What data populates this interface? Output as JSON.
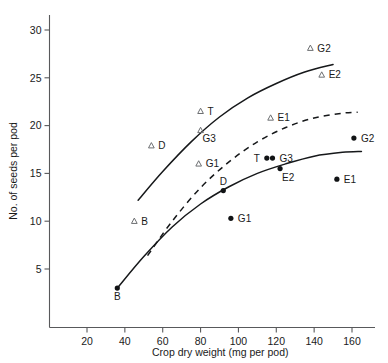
{
  "chart_data": {
    "type": "scatter",
    "title": "",
    "xlabel": "Crop dry weight (mg per pod)",
    "ylabel": "No. of seeds per pod",
    "xlim": [
      5,
      167
    ],
    "ylim": [
      1,
      32
    ],
    "grid": false,
    "legend": "none",
    "xticks": [
      20,
      40,
      60,
      80,
      100,
      120,
      140,
      160
    ],
    "yticks": [
      5,
      10,
      15,
      20,
      25,
      30
    ],
    "series": [
      {
        "name": "open-triangles",
        "marker": "open-triangle",
        "points": [
          {
            "label": "B",
            "x": 45,
            "y": 10.0,
            "label_side": "right"
          },
          {
            "label": "D",
            "x": 54,
            "y": 17.9,
            "label_side": "right"
          },
          {
            "label": "G1",
            "x": 79,
            "y": 16.0,
            "label_side": "right"
          },
          {
            "label": "G3",
            "x": 80,
            "y": 19.5,
            "label_side": "below-right"
          },
          {
            "label": "T",
            "x": 80,
            "y": 21.5,
            "label_side": "right"
          },
          {
            "label": "E1",
            "x": 117,
            "y": 20.8,
            "label_side": "right"
          },
          {
            "label": "G2",
            "x": 138,
            "y": 28.1,
            "label_side": "right"
          },
          {
            "label": "E2",
            "x": 144,
            "y": 25.3,
            "label_side": "right"
          }
        ]
      },
      {
        "name": "filled-circles",
        "marker": "filled-circle",
        "points": [
          {
            "label": "B",
            "x": 36,
            "y": 3.0,
            "label_side": "below"
          },
          {
            "label": "G1",
            "x": 96,
            "y": 10.3,
            "label_side": "right"
          },
          {
            "label": "D",
            "x": 92,
            "y": 13.2,
            "label_side": "above"
          },
          {
            "label": "T",
            "x": 115,
            "y": 16.6,
            "label_side": "left"
          },
          {
            "label": "G3",
            "x": 118,
            "y": 16.6,
            "label_side": "right"
          },
          {
            "label": "E2",
            "x": 122,
            "y": 15.5,
            "label_side": "below-right"
          },
          {
            "label": "E1",
            "x": 152,
            "y": 14.4,
            "label_side": "right"
          },
          {
            "label": "G2",
            "x": 161,
            "y": 18.7,
            "label_side": "right"
          }
        ]
      }
    ],
    "curves": [
      {
        "name": "upper-solid-curve",
        "style": "solid",
        "points": [
          {
            "x": 47,
            "y": 12.2
          },
          {
            "x": 60,
            "y": 15.2
          },
          {
            "x": 75,
            "y": 18.3
          },
          {
            "x": 90,
            "y": 20.9
          },
          {
            "x": 105,
            "y": 22.9
          },
          {
            "x": 120,
            "y": 24.4
          },
          {
            "x": 135,
            "y": 25.6
          },
          {
            "x": 150,
            "y": 26.4
          }
        ]
      },
      {
        "name": "middle-dashed-curve",
        "style": "dashed",
        "points": [
          {
            "x": 52,
            "y": 6.4
          },
          {
            "x": 65,
            "y": 10.0
          },
          {
            "x": 80,
            "y": 13.5
          },
          {
            "x": 95,
            "y": 16.2
          },
          {
            "x": 110,
            "y": 18.3
          },
          {
            "x": 125,
            "y": 19.8
          },
          {
            "x": 140,
            "y": 20.8
          },
          {
            "x": 155,
            "y": 21.3
          },
          {
            "x": 163,
            "y": 21.4
          }
        ]
      },
      {
        "name": "lower-solid-curve",
        "style": "solid",
        "points": [
          {
            "x": 36,
            "y": 3.0
          },
          {
            "x": 50,
            "y": 6.3
          },
          {
            "x": 65,
            "y": 9.4
          },
          {
            "x": 80,
            "y": 11.8
          },
          {
            "x": 95,
            "y": 13.6
          },
          {
            "x": 110,
            "y": 15.0
          },
          {
            "x": 125,
            "y": 16.0
          },
          {
            "x": 140,
            "y": 16.8
          },
          {
            "x": 155,
            "y": 17.2
          },
          {
            "x": 165,
            "y": 17.3
          }
        ]
      }
    ]
  }
}
